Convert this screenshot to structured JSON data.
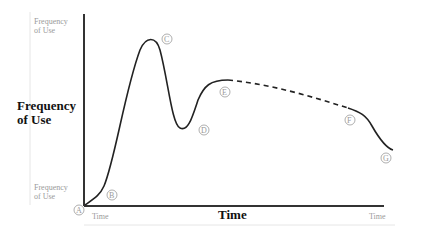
{
  "diagram": {
    "y_axis": {
      "top_label": "Frequency of Use",
      "main_label": "Frequency of Use",
      "bottom_label": "Frequency of Use"
    },
    "x_axis": {
      "left_label": "Time",
      "main_label": "Time",
      "right_label": "Time"
    },
    "points": [
      {
        "id": "A",
        "label": "A"
      },
      {
        "id": "B",
        "label": "B"
      },
      {
        "id": "C",
        "label": "C"
      },
      {
        "id": "D",
        "label": "D"
      },
      {
        "id": "E",
        "label": "E"
      },
      {
        "id": "F",
        "label": "F"
      },
      {
        "id": "G",
        "label": "G"
      }
    ],
    "curve": {
      "solid_segments": [
        "A-E",
        "F-G"
      ],
      "dashed_segment": "E-F"
    }
  }
}
